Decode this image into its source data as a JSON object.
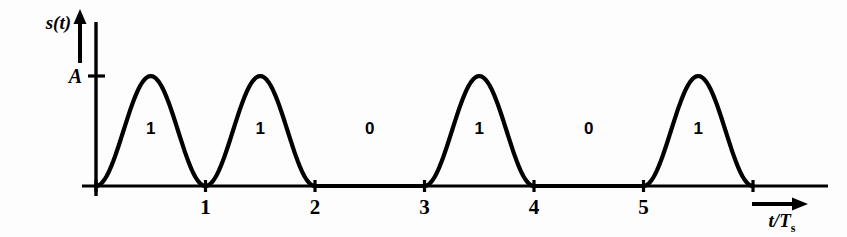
{
  "figure": {
    "background_color": "#fdfdfd",
    "line_color": "#000000",
    "stroke_width": 4.2
  },
  "axes": {
    "y_axis_label": "s(t)",
    "y_axis_arrow": "up-arrow",
    "amplitude_tick_label": "A",
    "x_axis_label_main": "t/T",
    "x_axis_label_sub": "s",
    "x_axis_arrow": "right-arrow",
    "x_tick_labels": [
      "1",
      "2",
      "3",
      "4",
      "5"
    ],
    "x_tick_values": [
      1,
      2,
      3,
      4,
      5
    ],
    "x_unlabeled_tick_values": [
      0,
      6
    ],
    "origin_px": {
      "x": 96,
      "y": 186
    },
    "amplitude_px_y": 76,
    "px_per_unit": 109.5
  },
  "bit_labels": [
    {
      "text": "1",
      "symbol_index": 0
    },
    {
      "text": "1",
      "symbol_index": 1
    },
    {
      "text": "0",
      "symbol_index": 2
    },
    {
      "text": "1",
      "symbol_index": 3
    },
    {
      "text": "0",
      "symbol_index": 4
    },
    {
      "text": "1",
      "symbol_index": 5
    }
  ],
  "chart_data": {
    "type": "line",
    "title": "",
    "subtitle": "",
    "xlabel": "t/Ts",
    "ylabel": "s(t)",
    "xlim": [
      -0.12,
      6.6
    ],
    "ylim": [
      -0.28,
      1.62
    ],
    "grid": false,
    "legend": null,
    "annotations": [
      "1",
      "1",
      "0",
      "1",
      "0",
      "1"
    ],
    "x_ticks": [
      1,
      2,
      3,
      4,
      5
    ],
    "x_tick_labels": [
      "1",
      "2",
      "3",
      "4",
      "5"
    ],
    "y_ticks": [
      1.0
    ],
    "y_tick_labels": [
      "A"
    ],
    "waveform": {
      "description": "Raised-cosine (half-sine-squared) pulse amplitude modulation of a binary bit sequence; each '1' bit renders one full raised-cosine pulse of peak amplitude A over its symbol interval, each '0' bit renders zero amplitude.",
      "pulse_shape": "raised-cosine",
      "pulse_formula": "A * sin(pi*(t - n)/1)^2  for n <= t < n+1 when bit=1, else 0",
      "amplitude": 1.0,
      "amplitude_symbol": "A",
      "symbol_period": 1.0,
      "bits": [
        1,
        1,
        0,
        1,
        0,
        1
      ],
      "symbol_start_times": [
        0,
        1,
        2,
        3,
        4,
        5
      ],
      "series": [
        {
          "name": "s(t)",
          "x": [
            0.0,
            0.1,
            0.2,
            0.3,
            0.4,
            0.5,
            0.6,
            0.7,
            0.8,
            0.9,
            1.0,
            1.1,
            1.2,
            1.3,
            1.4,
            1.5,
            1.6,
            1.7,
            1.8,
            1.9,
            2.0,
            2.25,
            2.5,
            2.75,
            3.0,
            3.1,
            3.2,
            3.3,
            3.4,
            3.5,
            3.6,
            3.7,
            3.8,
            3.9,
            4.0,
            4.25,
            4.5,
            4.75,
            5.0,
            5.1,
            5.2,
            5.3,
            5.4,
            5.5,
            5.6,
            5.7,
            5.8,
            5.9,
            6.0
          ],
          "y": [
            0.0,
            0.095,
            0.345,
            0.655,
            0.905,
            1.0,
            0.905,
            0.655,
            0.345,
            0.095,
            0.0,
            0.095,
            0.345,
            0.655,
            0.905,
            1.0,
            0.905,
            0.655,
            0.345,
            0.095,
            0.0,
            0.0,
            0.0,
            0.0,
            0.0,
            0.095,
            0.345,
            0.655,
            0.905,
            1.0,
            0.905,
            0.655,
            0.345,
            0.095,
            0.0,
            0.0,
            0.0,
            0.0,
            0.0,
            0.095,
            0.345,
            0.655,
            0.905,
            1.0,
            0.905,
            0.655,
            0.345,
            0.095,
            0.0
          ]
        }
      ]
    }
  }
}
